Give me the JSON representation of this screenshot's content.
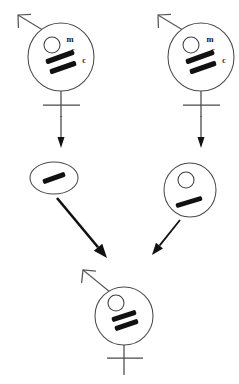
{
  "diagram": {
    "background_color": "#ffffff",
    "outline_color": "#4a4a4a",
    "chromatid_color": "#111111",
    "arrow_color": "#111111",
    "open_arrow_color": "#555555",
    "width": 239,
    "height": 384
  },
  "labels": {
    "m": "m",
    "c1": "c",
    "c2": "c"
  },
  "cells": [
    {
      "id": "parent-cell-left",
      "name": "parent-cell-left",
      "cx": 61,
      "cy": 57,
      "rx": 33,
      "ry": 34,
      "nucleus": {
        "cx": 52,
        "cy": 45,
        "r": 8
      },
      "chromatids": [
        {
          "x1": 46,
          "y1": 62,
          "x2": 74,
          "y2": 52,
          "w": 5.2
        },
        {
          "x1": 50,
          "y1": 72,
          "x2": 76,
          "y2": 63,
          "w": 5.2
        }
      ],
      "labels": [
        {
          "text": "m",
          "x": 70,
          "y": 40,
          "size": "normal"
        },
        {
          "text": "c",
          "x": 73,
          "y": 51,
          "size": "small"
        },
        {
          "text": "c",
          "x": 84,
          "y": 61,
          "size": "small"
        }
      ],
      "stem": {
        "x": 61,
        "y_top": 91,
        "y_bottom": 117,
        "bar_y": 105,
        "bar_x1": 43,
        "bar_x2": 80
      }
    },
    {
      "id": "parent-cell-right",
      "name": "parent-cell-right",
      "cx": 201,
      "cy": 57,
      "rx": 33,
      "ry": 34,
      "nucleus": {
        "cx": 191,
        "cy": 45,
        "r": 8
      },
      "chromatids": [
        {
          "x1": 186,
          "y1": 62,
          "x2": 214,
          "y2": 52,
          "w": 5.2
        },
        {
          "x1": 190,
          "y1": 72,
          "x2": 216,
          "y2": 63,
          "w": 5.2
        }
      ],
      "labels": [
        {
          "text": "m",
          "x": 210,
          "y": 40,
          "size": "normal"
        },
        {
          "text": "c",
          "x": 213,
          "y": 51,
          "size": "small"
        },
        {
          "text": "c",
          "x": 224,
          "y": 61,
          "size": "small"
        }
      ],
      "stem": {
        "x": 201,
        "y_top": 91,
        "y_bottom": 117,
        "bar_y": 105,
        "bar_x1": 183,
        "bar_x2": 220
      }
    },
    {
      "id": "daughter-cell-left",
      "name": "daughter-cell-left",
      "cx": 54,
      "cy": 178,
      "rx": 24,
      "ry": 16,
      "nucleus": null,
      "chromatids": [
        {
          "x1": 43,
          "y1": 182,
          "x2": 65,
          "y2": 174,
          "w": 5.0
        }
      ],
      "labels": [],
      "stem": null
    },
    {
      "id": "daughter-cell-right",
      "name": "daughter-cell-right",
      "cx": 190,
      "cy": 190,
      "rx": 26,
      "ry": 27,
      "nucleus": {
        "cx": 186,
        "cy": 180,
        "r": 8
      },
      "chromatids": [
        {
          "x1": 176,
          "y1": 206,
          "x2": 202,
          "y2": 198,
          "w": 4.6
        }
      ],
      "labels": [],
      "stem": null
    },
    {
      "id": "zygote-cell",
      "name": "zygote-cell",
      "cx": 124,
      "cy": 316,
      "rx": 29,
      "ry": 29,
      "nucleus": {
        "cx": 116,
        "cy": 303,
        "r": 8
      },
      "chromatids": [
        {
          "x1": 112,
          "y1": 320,
          "x2": 136,
          "y2": 312,
          "w": 5.0
        },
        {
          "x1": 115,
          "y1": 329,
          "x2": 138,
          "y2": 321,
          "w": 5.0
        }
      ],
      "labels": [],
      "stem": {
        "x": 124,
        "y_top": 345,
        "y_bottom": 375,
        "bar_y": 358,
        "bar_x1": 107,
        "bar_x2": 143
      }
    }
  ],
  "arrows": [
    {
      "id": "open-arrow-parent-left",
      "name": "open-arrow-parent-left",
      "style": "open-v",
      "x1": 46,
      "y1": 32,
      "x2": 18,
      "y2": 15
    },
    {
      "id": "open-arrow-parent-right",
      "name": "open-arrow-parent-right",
      "style": "open-v",
      "x1": 186,
      "y1": 32,
      "x2": 158,
      "y2": 15
    },
    {
      "id": "division-arrow-left",
      "name": "division-arrow-left",
      "style": "solid-down",
      "x1": 61,
      "y1": 116,
      "x2": 61,
      "y2": 148
    },
    {
      "id": "division-arrow-right",
      "name": "division-arrow-right",
      "style": "solid-down",
      "x1": 201,
      "y1": 116,
      "x2": 201,
      "y2": 148
    },
    {
      "id": "fusion-arrow-left",
      "name": "fusion-arrow-left",
      "style": "thick-diagonal",
      "x1": 57,
      "y1": 198,
      "x2": 107,
      "y2": 258
    },
    {
      "id": "fusion-arrow-right",
      "name": "fusion-arrow-right",
      "style": "mid-diagonal",
      "x1": 180,
      "y1": 220,
      "x2": 152,
      "y2": 255
    },
    {
      "id": "open-arrow-zygote",
      "name": "open-arrow-zygote",
      "style": "open-v",
      "x1": 110,
      "y1": 292,
      "x2": 83,
      "y2": 270
    }
  ]
}
